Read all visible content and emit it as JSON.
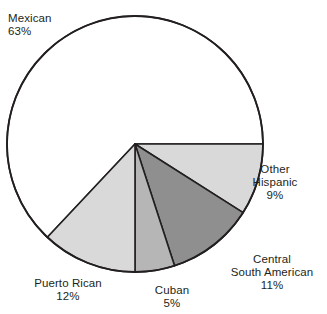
{
  "chart_data": {
    "type": "pie",
    "title": "",
    "subtitle": "",
    "xlabel": "",
    "ylabel": "",
    "legend_position": "none",
    "grid": false,
    "units": "percent",
    "start_angle_deg": 0,
    "direction": "clockwise",
    "categories": [
      "Mexican",
      "Other Hispanic",
      "Central South American",
      "Cuban",
      "Puerto Rican"
    ],
    "values": [
      63,
      9,
      11,
      5,
      12
    ],
    "slices": [
      {
        "id": "mexican",
        "label": "Mexican",
        "value": 63,
        "value_text": "63%",
        "color": "#ffffff",
        "start_deg": 133.2,
        "end_deg": 360.0,
        "label_lines": [
          "Mexican",
          "63%"
        ]
      },
      {
        "id": "other-hispanic",
        "label": "Other Hispanic",
        "value": 9,
        "value_text": "9%",
        "color": "#d9d9d9",
        "start_deg": 0.0,
        "end_deg": 32.4,
        "label_lines": [
          "Other",
          "Hispanic",
          "9%"
        ]
      },
      {
        "id": "central-south-american",
        "label": "Central South American",
        "value": 11,
        "value_text": "11%",
        "color": "#8f8f8f",
        "start_deg": 32.4,
        "end_deg": 72.0,
        "label_lines": [
          "Central",
          "South American",
          "11%"
        ]
      },
      {
        "id": "cuban",
        "label": "Cuban",
        "value": 5,
        "value_text": "5%",
        "color": "#b6b6b6",
        "start_deg": 72.0,
        "end_deg": 90.0,
        "label_lines": [
          "Cuban",
          "5%"
        ]
      },
      {
        "id": "puerto-rican",
        "label": "Puerto Rican",
        "value": 12,
        "value_text": "12%",
        "color": "#d9d9d9",
        "start_deg": 90.0,
        "end_deg": 133.2,
        "label_lines": [
          "Puerto Rican",
          "12%"
        ]
      }
    ]
  },
  "labels": {
    "mexican": {
      "name": "Mexican",
      "value": "63%"
    },
    "other_hispanic": {
      "name_line1": "Other",
      "name_line2": "Hispanic",
      "value": "9%"
    },
    "central_south_american": {
      "name_line1": "Central",
      "name_line2": "South American",
      "value": "11%"
    },
    "cuban": {
      "name": "Cuban",
      "value": "5%"
    },
    "puerto_rican": {
      "name": "Puerto Rican",
      "value": "12%"
    }
  },
  "style": {
    "background": "#ffffff",
    "outline": "#231f20",
    "text": "#231f20",
    "light_gray": "#d9d9d9",
    "mid_gray": "#b6b6b6",
    "dark_gray": "#8f8f8f",
    "white": "#ffffff"
  },
  "geometry": {
    "cx": 135,
    "cy": 144,
    "r": 128
  }
}
